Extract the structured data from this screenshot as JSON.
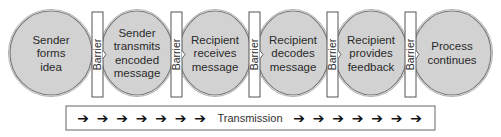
{
  "diagram": {
    "type": "process-flow",
    "steps": [
      {
        "lines": [
          "Sender",
          "forms",
          "idea"
        ]
      },
      {
        "lines": [
          "Sender",
          "transmits",
          "encoded",
          "message"
        ]
      },
      {
        "lines": [
          "Recipient",
          "receives",
          "message"
        ]
      },
      {
        "lines": [
          "Recipient",
          "decodes",
          "message"
        ]
      },
      {
        "lines": [
          "Recipient",
          "provides",
          "feedback"
        ]
      },
      {
        "lines": [
          "Process",
          "continues"
        ]
      }
    ],
    "barrier_label": "Barrier",
    "barrier_count": 5,
    "transmission": {
      "label": "Transmission",
      "arrow_glyph": "➔",
      "arrows_left": 7,
      "arrows_right": 7
    },
    "colors": {
      "circle_fill": "#d2d2d2",
      "circle_stroke": "#7a7a7a",
      "barrier_fill": "#ffffff",
      "text": "#2a2a2a"
    }
  }
}
